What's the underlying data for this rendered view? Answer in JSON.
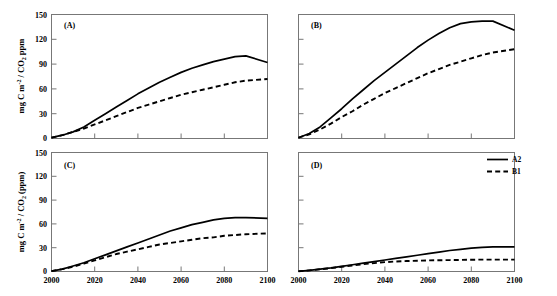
{
  "figure": {
    "title": "",
    "panels": [
      "A",
      "B",
      "C",
      "D"
    ]
  },
  "chart_data": [
    {
      "type": "line",
      "panel": "A",
      "tag": "(A)",
      "title": "",
      "xlabel": "",
      "ylabel": "mg C m-2 / CO2 ppm",
      "ylabel_parts": {
        "pre": "mg C m",
        "sup": "-2",
        "mid": " / CO",
        "sub": "2",
        "post": " ppm"
      },
      "xlim": [
        2000,
        2100
      ],
      "ylim": [
        0,
        150
      ],
      "xticks": [
        2000,
        2020,
        2040,
        2060,
        2080,
        2100
      ],
      "yticks": [
        0,
        30,
        60,
        90,
        120,
        150
      ],
      "xticklabels": [
        "2000",
        "2020",
        "2040",
        "2060",
        "2080",
        "2100"
      ],
      "yticklabels": [
        "0",
        "30",
        "60",
        "90",
        "120",
        "150"
      ],
      "show_xticklabels": false,
      "show_yticklabels": true,
      "grid": false,
      "x": [
        2000,
        2005,
        2010,
        2015,
        2020,
        2025,
        2030,
        2035,
        2040,
        2045,
        2050,
        2055,
        2060,
        2065,
        2070,
        2075,
        2080,
        2085,
        2090,
        2100
      ],
      "series": [
        {
          "name": "A2",
          "style": "solid",
          "values": [
            1,
            4,
            8,
            14,
            22,
            30,
            38,
            46,
            54,
            61,
            68,
            74,
            80,
            85,
            89,
            93,
            96,
            99,
            100,
            92
          ]
        },
        {
          "name": "B1",
          "style": "dashed",
          "values": [
            1,
            4,
            8,
            12,
            17,
            22,
            27,
            32,
            37,
            41,
            45,
            49,
            53,
            56,
            59,
            62,
            65,
            68,
            70,
            72
          ]
        }
      ]
    },
    {
      "type": "line",
      "panel": "B",
      "tag": "(B)",
      "title": "",
      "xlabel": "",
      "ylabel": "",
      "xlim": [
        2000,
        2100
      ],
      "ylim": [
        0,
        150
      ],
      "xticks": [
        2000,
        2020,
        2040,
        2060,
        2080,
        2100
      ],
      "yticks": [
        0,
        30,
        60,
        90,
        120,
        150
      ],
      "xticklabels": [
        "2000",
        "2020",
        "2040",
        "2060",
        "2080",
        "2100"
      ],
      "yticklabels": [],
      "show_xticklabels": false,
      "show_yticklabels": false,
      "grid": false,
      "x": [
        2000,
        2005,
        2010,
        2015,
        2020,
        2025,
        2030,
        2035,
        2040,
        2045,
        2050,
        2055,
        2060,
        2065,
        2070,
        2075,
        2080,
        2085,
        2090,
        2100
      ],
      "series": [
        {
          "name": "A2",
          "style": "solid",
          "values": [
            1,
            6,
            14,
            25,
            36,
            48,
            59,
            70,
            80,
            90,
            100,
            110,
            119,
            127,
            134,
            139,
            141,
            142,
            142,
            131
          ]
        },
        {
          "name": "B1",
          "style": "dashed",
          "values": [
            1,
            5,
            11,
            18,
            26,
            33,
            41,
            48,
            55,
            61,
            67,
            73,
            79,
            84,
            89,
            93,
            97,
            101,
            104,
            108
          ]
        }
      ]
    },
    {
      "type": "line",
      "panel": "C",
      "tag": "(C)",
      "title": "",
      "xlabel": "",
      "ylabel": "mg C m-2 / CO2 (ppm)",
      "ylabel_parts": {
        "pre": "mg C m",
        "sup": "-2",
        "mid": " / CO",
        "sub": "2",
        "post": " (ppm)"
      },
      "xlim": [
        2000,
        2100
      ],
      "ylim": [
        0,
        150
      ],
      "xticks": [
        2000,
        2020,
        2040,
        2060,
        2080,
        2100
      ],
      "yticks": [
        0,
        30,
        60,
        90,
        120,
        150
      ],
      "xticklabels": [
        "2000",
        "2020",
        "2040",
        "2060",
        "2080",
        "2100"
      ],
      "yticklabels": [
        "0",
        "30",
        "60",
        "90",
        "120",
        "150"
      ],
      "show_xticklabels": true,
      "show_yticklabels": true,
      "grid": false,
      "x": [
        2000,
        2005,
        2010,
        2015,
        2020,
        2025,
        2030,
        2035,
        2040,
        2045,
        2050,
        2055,
        2060,
        2065,
        2070,
        2075,
        2080,
        2085,
        2090,
        2100
      ],
      "series": [
        {
          "name": "A2",
          "style": "solid",
          "values": [
            0.5,
            3,
            7,
            11,
            16,
            21,
            26,
            31,
            36,
            41,
            46,
            51,
            55,
            59,
            62,
            65,
            67,
            68,
            68,
            67
          ]
        },
        {
          "name": "B1",
          "style": "dashed",
          "values": [
            0.5,
            3,
            6,
            10,
            14,
            18,
            22,
            25,
            28,
            31,
            34,
            36,
            38,
            40,
            42,
            43,
            45,
            46,
            47,
            48
          ]
        }
      ]
    },
    {
      "type": "line",
      "panel": "D",
      "tag": "(D)",
      "title": "",
      "xlabel": "",
      "ylabel": "",
      "xlim": [
        2000,
        2100
      ],
      "ylim": [
        0,
        150
      ],
      "xticks": [
        2000,
        2020,
        2040,
        2060,
        2080,
        2100
      ],
      "yticks": [
        0,
        30,
        60,
        90,
        120,
        150
      ],
      "xticklabels": [
        "2000",
        "2020",
        "2040",
        "2060",
        "2080",
        "2100"
      ],
      "yticklabels": [],
      "show_xticklabels": true,
      "show_yticklabels": false,
      "grid": false,
      "x": [
        2000,
        2005,
        2010,
        2015,
        2020,
        2025,
        2030,
        2035,
        2040,
        2045,
        2050,
        2055,
        2060,
        2065,
        2070,
        2075,
        2080,
        2085,
        2090,
        2100
      ],
      "series": [
        {
          "name": "A2",
          "style": "solid",
          "values": [
            0.3,
            1.5,
            3,
            4.5,
            6.5,
            8.5,
            10.5,
            12.5,
            14.5,
            16.5,
            18.5,
            20.5,
            22.5,
            24.5,
            26.5,
            28,
            29.5,
            30.5,
            31,
            31
          ]
        },
        {
          "name": "B1",
          "style": "dashed",
          "values": [
            0.3,
            1.4,
            2.8,
            4.2,
            6,
            7.6,
            9.2,
            10.6,
            11.8,
            12.6,
            13.2,
            13.6,
            14,
            14.2,
            14.4,
            14.6,
            14.8,
            15,
            15,
            15
          ]
        }
      ]
    }
  ],
  "legend": {
    "position": "panel-D-top-right",
    "entries": [
      {
        "label": "A2",
        "style": "solid"
      },
      {
        "label": "B1",
        "style": "dashed"
      }
    ]
  }
}
